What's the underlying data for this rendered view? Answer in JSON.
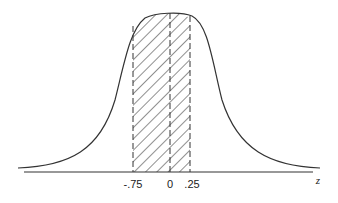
{
  "diagram": {
    "type": "normal-distribution-shaded-area",
    "axis_label": "z",
    "ticks": [
      {
        "value": -0.75,
        "label": "-.75",
        "x": 133
      },
      {
        "value": 0,
        "label": "0",
        "x": 170
      },
      {
        "value": 0.25,
        "label": ".25",
        "x": 190
      }
    ],
    "shaded_region": {
      "from": -0.75,
      "to": 0.25,
      "pattern": "diagonal-hatch"
    },
    "colors": {
      "stroke": "#333333",
      "background": "#ffffff"
    }
  }
}
